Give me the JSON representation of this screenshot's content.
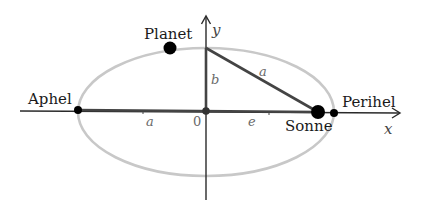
{
  "diagram": {
    "colors": {
      "axis": "#2a2a2a",
      "ellipse": "#c8c8c8",
      "segment": "#444444",
      "point": "#000000",
      "label": "#1a1a1a",
      "math_label": "#6a6a6a"
    },
    "axes": {
      "x_label": "x",
      "y_label": "y",
      "origin_label": "0"
    },
    "points": {
      "aphel": "Aphel",
      "perihel": "Perihel",
      "sun": "Sonne",
      "planet": "Planet"
    },
    "segments": {
      "semi_major_horizontal": "a",
      "semi_minor": "b",
      "hypotenuse": "a",
      "eccentricity": "e"
    }
  }
}
